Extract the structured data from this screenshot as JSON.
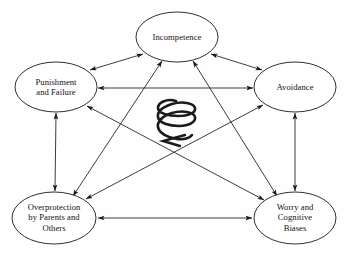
{
  "figure": {
    "type": "cycle-diagram",
    "background_color": "#fefefe",
    "stroke_color": "#1a1a1a",
    "center_symbol": "downward-spiral-arrow"
  },
  "nodes": [
    {
      "id": "incompetence",
      "label": "Incompetence",
      "cx": 177,
      "cy": 37,
      "rx": 41,
      "ry": 25
    },
    {
      "id": "punishment-and-failure",
      "label": "Punishment\nand Failure",
      "cx": 56,
      "cy": 87,
      "rx": 41,
      "ry": 25
    },
    {
      "id": "avoidance",
      "label": "Avoidance",
      "cx": 295,
      "cy": 87,
      "rx": 41,
      "ry": 25
    },
    {
      "id": "overprotection-by-parents-and-others",
      "label": "Overprotection\nby Parents and\nOthers",
      "cx": 54,
      "cy": 218,
      "rx": 42,
      "ry": 26
    },
    {
      "id": "worry-and-cognitive-biases",
      "label": "Worry and\nCognitive\nBiases",
      "cx": 295,
      "cy": 218,
      "rx": 41,
      "ry": 26
    }
  ],
  "edges": [
    {
      "id": "punishment-incompetence",
      "from": "punishment-and-failure",
      "to": "incompetence",
      "style": "double-arrow"
    },
    {
      "id": "incompetence-avoidance",
      "from": "incompetence",
      "to": "avoidance",
      "style": "double-arrow"
    },
    {
      "id": "punishment-avoidance",
      "from": "punishment-and-failure",
      "to": "avoidance",
      "style": "double-arrow"
    },
    {
      "id": "punishment-overprotection",
      "from": "punishment-and-failure",
      "to": "overprotection-by-parents-and-others",
      "style": "double-arrow"
    },
    {
      "id": "avoidance-worry",
      "from": "avoidance",
      "to": "worry-and-cognitive-biases",
      "style": "double-arrow"
    },
    {
      "id": "overprotection-worry",
      "from": "overprotection-by-parents-and-others",
      "to": "worry-and-cognitive-biases",
      "style": "double-arrow"
    },
    {
      "id": "incompetence-overprotection",
      "from": "incompetence",
      "to": "overprotection-by-parents-and-others",
      "style": "double-arrow"
    },
    {
      "id": "incompetence-worry",
      "from": "incompetence",
      "to": "worry-and-cognitive-biases",
      "style": "double-arrow"
    },
    {
      "id": "punishment-worry",
      "from": "punishment-and-failure",
      "to": "worry-and-cognitive-biases",
      "style": "double-arrow"
    },
    {
      "id": "avoidance-overprotection",
      "from": "avoidance",
      "to": "overprotection-by-parents-and-others",
      "style": "double-arrow"
    }
  ]
}
